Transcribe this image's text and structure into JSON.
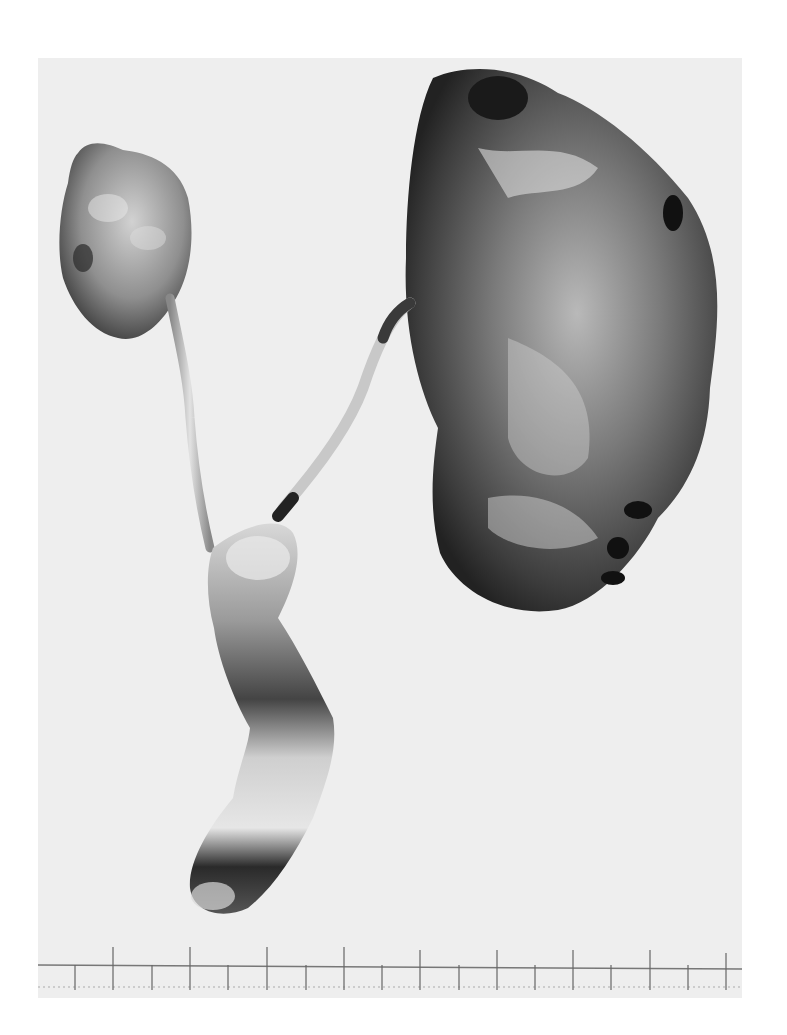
{
  "figure": {
    "type": "grayscale specimen photograph",
    "background_color": "#eeeeee",
    "page_color": "#ffffff",
    "specimens": [
      {
        "name": "small-kidney",
        "position": "upper-left"
      },
      {
        "name": "large-kidney",
        "position": "upper-right"
      },
      {
        "name": "left-ureter",
        "position": "left-center"
      },
      {
        "name": "right-ureter",
        "position": "center"
      },
      {
        "name": "bladder-urethra",
        "position": "lower-center"
      }
    ],
    "ruler": {
      "position": "bottom",
      "major_ticks": 9,
      "labels": []
    }
  }
}
